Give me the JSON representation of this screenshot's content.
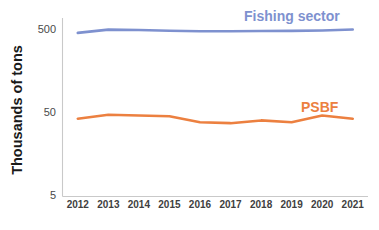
{
  "chart_data": {
    "type": "line",
    "title": "",
    "subtitle": "",
    "xlabel": "",
    "ylabel": "Thousands of tons",
    "x": [
      2012,
      2013,
      2014,
      2015,
      2016,
      2017,
      2018,
      2019,
      2020,
      2021
    ],
    "categories": [
      "2012",
      "2013",
      "2014",
      "2015",
      "2016",
      "2017",
      "2018",
      "2019",
      "2020",
      "2021"
    ],
    "yscale": "log",
    "ylim": [
      5,
      700
    ],
    "yticks": [
      5,
      50,
      500
    ],
    "ytick_labels": [
      "5",
      "50",
      "500"
    ],
    "grid": false,
    "legend_position": "inline-right",
    "series": [
      {
        "name": "Fishing sector",
        "color": "#7e91cf",
        "label_color": "#7e91cf",
        "values": [
          462,
          505,
          500,
          490,
          484,
          484,
          487,
          488,
          493,
          506
        ]
      },
      {
        "name": "PSBF",
        "color": "#ec8040",
        "label_color": "#ec8040",
        "values": [
          43,
          48,
          47,
          46,
          39,
          38,
          41,
          39,
          47,
          43
        ]
      }
    ],
    "annotations": [
      {
        "text": "Fishing sector",
        "series": "Fishing sector",
        "x": 2019.0,
        "placement": "above-line"
      },
      {
        "text": "PSBF",
        "series": "PSBF",
        "x": 2019.9,
        "placement": "above-line"
      }
    ]
  },
  "axis": {
    "y_tick_500": "500",
    "y_tick_50": "50",
    "y_tick_5": "5",
    "y_axis_title": "Thousands of tons",
    "x_ticks": [
      "2012",
      "2013",
      "2014",
      "2015",
      "2016",
      "2017",
      "2018",
      "2019",
      "2020",
      "2021"
    ]
  },
  "legend": {
    "fishing_sector_label": "Fishing sector",
    "psbf_label": "PSBF"
  },
  "colors": {
    "fishing_sector": "#7e91cf",
    "psbf": "#ec8040",
    "axis": "#c9c9c9",
    "text": "#1a1a1a",
    "background": "#ffffff"
  }
}
